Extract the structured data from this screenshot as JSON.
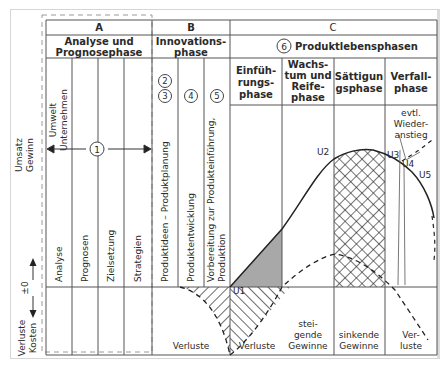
{
  "y_axis": {
    "top_label": [
      "Umsatz",
      "Gewinn"
    ],
    "bottom_label": [
      "Verluste",
      "Kosten"
    ],
    "zero_label": "±0"
  },
  "sections": {
    "A": {
      "letter": "A",
      "title": [
        "Analyse und",
        "Prognosephase"
      ],
      "marker": "1",
      "top_column_label": [
        "Umwelt",
        "Unternehmen"
      ],
      "columns": [
        "Analyse",
        "Prognosen",
        "Zielsetzung",
        "Strategien"
      ]
    },
    "B": {
      "letter": "B",
      "title": [
        "Innovations-",
        "phase"
      ],
      "markers": [
        "2",
        "3",
        "4",
        "5"
      ],
      "columns": [
        "Produktideen – Produktplanung",
        "Produktentwicklung",
        "Vorbereitung zur Produkteinführung,",
        "Produktion"
      ],
      "bottom_label": "Verluste"
    },
    "C": {
      "letter": "C",
      "marker": "6",
      "title": "Produktlebensphasen",
      "phases": [
        {
          "name": [
            "Einfüh-",
            "rungs-",
            "phase"
          ],
          "bottom": [
            "Verluste"
          ]
        },
        {
          "name": [
            "Wachs-",
            "tum und",
            "Reife-",
            "phase"
          ],
          "bottom": [
            "stei-",
            "gende",
            "Gewinne"
          ]
        },
        {
          "name": [
            "Sättigun",
            "gsphase"
          ],
          "bottom": [
            "sinkende",
            "Gewinne"
          ]
        },
        {
          "name": [
            "Verfall-",
            "phase"
          ],
          "bottom": [
            "Ver-",
            "luste"
          ]
        }
      ],
      "annotation": [
        "evtl.",
        "Wieder-",
        "anstieg"
      ],
      "curve_labels": [
        "U1",
        "U2",
        "U3",
        "U4",
        "U5"
      ]
    }
  },
  "colors": {
    "line": "#2a2a2a",
    "grid": "#555555",
    "fill_intro": "#a8a8a8",
    "frame": "#d6d6d6"
  }
}
